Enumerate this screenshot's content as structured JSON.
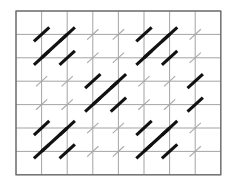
{
  "figure": {
    "background_color": "#ffffff",
    "grid_line_color": "#9a9a9a",
    "grid_border_color": "#6a6a6a",
    "bold_mark_color": "#111111",
    "light_mark_color": "#a8a8a8"
  },
  "grid": {
    "columns": 8,
    "rows": 7,
    "x0": 16,
    "y0": 11,
    "cell_width": 25.6,
    "cell_height": 23.4,
    "x_lines": [
      16,
      41.6,
      67.2,
      92.8,
      118.4,
      144,
      169.6,
      195.2,
      220.8
    ],
    "y_lines": [
      11,
      34.4,
      57.8,
      81.2,
      104.6,
      128,
      151.4,
      174.8
    ]
  },
  "chart_data": {
    "type": "scatter",
    "xlabel": "",
    "ylabel": "",
    "grid": true,
    "legend": null,
    "xlim": [
      0,
      8
    ],
    "ylim": [
      0,
      7
    ],
    "categories": [
      "light",
      "bold"
    ],
    "marks": [
      {
        "col": 1,
        "row": 1,
        "weight": "bold"
      },
      {
        "col": 2,
        "row": 1,
        "weight": "bold"
      },
      {
        "col": 3,
        "row": 1,
        "weight": "light"
      },
      {
        "col": 4,
        "row": 1,
        "weight": "light"
      },
      {
        "col": 5,
        "row": 1,
        "weight": "bold"
      },
      {
        "col": 6,
        "row": 1,
        "weight": "bold"
      },
      {
        "col": 7,
        "row": 1,
        "weight": "light"
      },
      {
        "col": 1,
        "row": 2,
        "weight": "bold"
      },
      {
        "col": 2,
        "row": 2,
        "weight": "bold"
      },
      {
        "col": 3,
        "row": 2,
        "weight": "light"
      },
      {
        "col": 4,
        "row": 2,
        "weight": "light"
      },
      {
        "col": 5,
        "row": 2,
        "weight": "bold"
      },
      {
        "col": 6,
        "row": 2,
        "weight": "bold"
      },
      {
        "col": 7,
        "row": 2,
        "weight": "light"
      },
      {
        "col": 1,
        "row": 3,
        "weight": "light"
      },
      {
        "col": 2,
        "row": 3,
        "weight": "light"
      },
      {
        "col": 3,
        "row": 3,
        "weight": "bold"
      },
      {
        "col": 4,
        "row": 3,
        "weight": "bold"
      },
      {
        "col": 5,
        "row": 3,
        "weight": "light"
      },
      {
        "col": 6,
        "row": 3,
        "weight": "light"
      },
      {
        "col": 7,
        "row": 3,
        "weight": "bold"
      },
      {
        "col": 1,
        "row": 4,
        "weight": "light"
      },
      {
        "col": 2,
        "row": 4,
        "weight": "light"
      },
      {
        "col": 3,
        "row": 4,
        "weight": "bold"
      },
      {
        "col": 4,
        "row": 4,
        "weight": "bold"
      },
      {
        "col": 5,
        "row": 4,
        "weight": "light"
      },
      {
        "col": 6,
        "row": 4,
        "weight": "light"
      },
      {
        "col": 7,
        "row": 4,
        "weight": "bold"
      },
      {
        "col": 1,
        "row": 5,
        "weight": "bold"
      },
      {
        "col": 2,
        "row": 5,
        "weight": "bold"
      },
      {
        "col": 3,
        "row": 5,
        "weight": "light"
      },
      {
        "col": 4,
        "row": 5,
        "weight": "light"
      },
      {
        "col": 5,
        "row": 5,
        "weight": "bold"
      },
      {
        "col": 6,
        "row": 5,
        "weight": "bold"
      },
      {
        "col": 7,
        "row": 5,
        "weight": "light"
      },
      {
        "col": 1,
        "row": 6,
        "weight": "bold"
      },
      {
        "col": 2,
        "row": 6,
        "weight": "bold"
      },
      {
        "col": 3,
        "row": 6,
        "weight": "light"
      },
      {
        "col": 4,
        "row": 6,
        "weight": "light"
      },
      {
        "col": 5,
        "row": 6,
        "weight": "bold"
      },
      {
        "col": 6,
        "row": 6,
        "weight": "bold"
      },
      {
        "col": 7,
        "row": 6,
        "weight": "light"
      }
    ],
    "long_diagonals": [
      {
        "from_col": 1,
        "from_row": 2,
        "to_col": 2,
        "to_row": 1
      },
      {
        "from_col": 5,
        "from_row": 2,
        "to_col": 6,
        "to_row": 1
      },
      {
        "from_col": 3,
        "from_row": 4,
        "to_col": 4,
        "to_row": 3
      },
      {
        "from_col": 1,
        "from_row": 6,
        "to_col": 2,
        "to_row": 5
      },
      {
        "from_col": 5,
        "from_row": 6,
        "to_col": 6,
        "to_row": 5
      }
    ],
    "mark_angle_degrees": 45,
    "mark_direction": "up-right"
  }
}
